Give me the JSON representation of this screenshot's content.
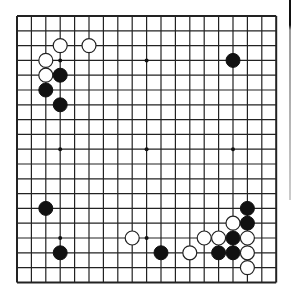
{
  "board": {
    "size": 19,
    "origin_x": 17,
    "origin_y": 16,
    "spacing_x": 14.4,
    "spacing_y": 14.8,
    "stone_radius": 7,
    "line_color": "#222222",
    "background": "#ffffff",
    "star_points": [
      [
        3,
        3
      ],
      [
        9,
        3
      ],
      [
        15,
        3
      ],
      [
        3,
        9
      ],
      [
        9,
        9
      ],
      [
        15,
        9
      ],
      [
        3,
        15
      ],
      [
        9,
        15
      ],
      [
        15,
        15
      ]
    ],
    "stones": [
      {
        "color": "white",
        "col": 3,
        "row": 2
      },
      {
        "color": "white",
        "col": 5,
        "row": 2
      },
      {
        "color": "white",
        "col": 2,
        "row": 3
      },
      {
        "color": "white",
        "col": 2,
        "row": 4
      },
      {
        "color": "black",
        "col": 3,
        "row": 4
      },
      {
        "color": "black",
        "col": 2,
        "row": 5
      },
      {
        "color": "black",
        "col": 3,
        "row": 6
      },
      {
        "color": "black",
        "col": 15,
        "row": 3
      },
      {
        "color": "black",
        "col": 2,
        "row": 13
      },
      {
        "color": "black",
        "col": 3,
        "row": 16
      },
      {
        "color": "white",
        "col": 8,
        "row": 15
      },
      {
        "color": "black",
        "col": 10,
        "row": 16
      },
      {
        "color": "white",
        "col": 12,
        "row": 16
      },
      {
        "color": "white",
        "col": 13,
        "row": 15
      },
      {
        "color": "black",
        "col": 14,
        "row": 16
      },
      {
        "color": "white",
        "col": 14,
        "row": 15
      },
      {
        "color": "black",
        "col": 15,
        "row": 15
      },
      {
        "color": "black",
        "col": 15,
        "row": 16
      },
      {
        "color": "white",
        "col": 15,
        "row": 14
      },
      {
        "color": "black",
        "col": 16,
        "row": 13
      },
      {
        "color": "black",
        "col": 16,
        "row": 14
      },
      {
        "color": "white",
        "col": 16,
        "row": 15
      },
      {
        "color": "white",
        "col": 16,
        "row": 16
      },
      {
        "color": "white",
        "col": 16,
        "row": 17
      }
    ]
  }
}
